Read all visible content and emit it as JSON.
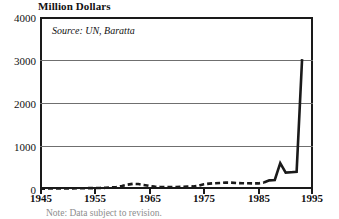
{
  "chart_data": {
    "type": "line",
    "title": "Million Dollars",
    "xlabel": "",
    "ylabel": "Million Dollars",
    "annotation": "Source: UN, Baratta",
    "footnote": "Note: Data subject to revision.",
    "grid": true,
    "legend_position": "none",
    "xlim": [
      1945,
      1995
    ],
    "ylim": [
      0,
      4000
    ],
    "xticks": [
      1945,
      1955,
      1965,
      1975,
      1985,
      1995
    ],
    "yticks": [
      0,
      1000,
      2000,
      3000,
      4000
    ],
    "series": [
      {
        "name": "Value",
        "style": "dashed-then-solid",
        "solid_from_x": 1986,
        "x": [
          1945,
          1946,
          1947,
          1948,
          1949,
          1950,
          1951,
          1952,
          1953,
          1954,
          1955,
          1956,
          1957,
          1958,
          1959,
          1960,
          1961,
          1962,
          1963,
          1964,
          1965,
          1966,
          1967,
          1968,
          1969,
          1970,
          1971,
          1972,
          1973,
          1974,
          1975,
          1976,
          1977,
          1978,
          1979,
          1980,
          1981,
          1982,
          1983,
          1984,
          1985,
          1986,
          1987,
          1988,
          1989,
          1990,
          1991,
          1992,
          1993
        ],
        "values": [
          10,
          10,
          12,
          12,
          14,
          15,
          15,
          16,
          18,
          20,
          22,
          25,
          28,
          35,
          45,
          70,
          100,
          120,
          115,
          95,
          70,
          55,
          48,
          45,
          45,
          48,
          50,
          55,
          60,
          75,
          110,
          125,
          135,
          140,
          150,
          148,
          140,
          135,
          132,
          130,
          130,
          150,
          200,
          210,
          600,
          380,
          390,
          400,
          3020
        ]
      }
    ]
  },
  "axis": {
    "y_labels": [
      "4000",
      "3000",
      "2000",
      "1000",
      "0"
    ],
    "x_labels": [
      "1945",
      "1955",
      "1965",
      "1975",
      "1985",
      "1995"
    ]
  },
  "colors": {
    "line": "#1a1a1a",
    "grid": "#6f6f6f",
    "frame": "#1a1a1a",
    "background": "#ffffff"
  }
}
